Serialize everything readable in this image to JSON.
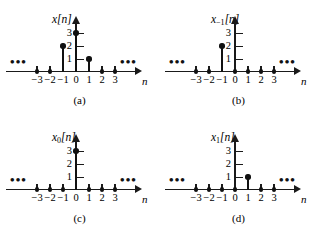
{
  "figure": {
    "kind": "discrete-time-signal-stem-plots",
    "background": "#ffffff",
    "ink_color": "#111111",
    "ellipsis_glyph": "•••",
    "axis_label_x": "n",
    "y_ticks": [
      "1",
      "2",
      "3"
    ],
    "x_ticks": [
      "−3",
      "−2",
      "−1",
      "0",
      "1",
      "2",
      "3"
    ]
  },
  "chart_data": [
    {
      "type": "bar",
      "panel": "a",
      "caption": "(a)",
      "title": "x[n]",
      "title_base": "x",
      "title_sub": "",
      "title_bracket": "[n]",
      "xlabel": "n",
      "ylabel": "",
      "categories": [
        -3,
        -2,
        -1,
        0,
        1,
        2,
        3
      ],
      "values": [
        0,
        0,
        2,
        3,
        1,
        0,
        0
      ],
      "xlim": [
        -3.6,
        3.6
      ],
      "ylim": [
        0,
        3.5
      ],
      "grid": false,
      "legend": "none",
      "annotations": [
        "••• left",
        "••• right"
      ]
    },
    {
      "type": "bar",
      "panel": "b",
      "caption": "(b)",
      "title": "x₁[n]",
      "title_base": "x",
      "title_sub": "−1",
      "title_bracket": "[n]",
      "xlabel": "n",
      "ylabel": "",
      "categories": [
        -3,
        -2,
        -1,
        0,
        1,
        2,
        3
      ],
      "values": [
        0,
        0,
        2,
        0,
        0,
        0,
        0
      ],
      "xlim": [
        -3.6,
        3.6
      ],
      "ylim": [
        0,
        3.5
      ],
      "grid": false,
      "legend": "none",
      "annotations": [
        "••• left",
        "••• right"
      ]
    },
    {
      "type": "bar",
      "panel": "c",
      "caption": "(c)",
      "title": "x0[n]",
      "title_base": "x",
      "title_sub": "0",
      "title_bracket": "[n]",
      "xlabel": "n",
      "ylabel": "",
      "categories": [
        -3,
        -2,
        -1,
        0,
        1,
        2,
        3
      ],
      "values": [
        0,
        0,
        0,
        3,
        0,
        0,
        0
      ],
      "xlim": [
        -3.6,
        3.6
      ],
      "ylim": [
        0,
        3.5
      ],
      "grid": false,
      "legend": "none",
      "annotations": [
        "••• left",
        "••• right"
      ]
    },
    {
      "type": "bar",
      "panel": "d",
      "caption": "(d)",
      "title": "x1[n]",
      "title_base": "x",
      "title_sub": "1",
      "title_bracket": "[n]",
      "xlabel": "n",
      "ylabel": "",
      "categories": [
        -3,
        -2,
        -1,
        0,
        1,
        2,
        3
      ],
      "values": [
        0,
        0,
        0,
        0,
        1,
        0,
        0
      ],
      "xlim": [
        -3.6,
        3.6
      ],
      "ylim": [
        0,
        3.5
      ],
      "grid": false,
      "legend": "none",
      "annotations": [
        "••• left",
        "••• right"
      ]
    }
  ]
}
